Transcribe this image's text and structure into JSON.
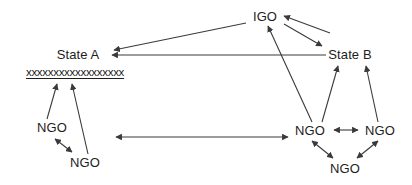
{
  "diagram": {
    "background_color": "#ffffff",
    "line_color": "#3a3a3a",
    "text_color": "#1d1d1d",
    "nodes": [
      {
        "id": "igo",
        "label": "IGO",
        "x": 265,
        "y": 16,
        "kind": "igo"
      },
      {
        "id": "state-a",
        "label": "State A",
        "x": 78,
        "y": 54,
        "kind": "state"
      },
      {
        "id": "state-b",
        "label": "State B",
        "x": 350,
        "y": 54,
        "kind": "state"
      },
      {
        "id": "redacted",
        "label": "xxxxxxxxxxxxxxxxxx",
        "x": 75,
        "y": 72,
        "kind": "redacted"
      },
      {
        "id": "ngo-left-1",
        "label": "NGO",
        "x": 52,
        "y": 127,
        "kind": "ngo"
      },
      {
        "id": "ngo-left-2",
        "label": "NGO",
        "x": 85,
        "y": 162,
        "kind": "ngo"
      },
      {
        "id": "ngo-right-1",
        "label": "NGO",
        "x": 310,
        "y": 130,
        "kind": "ngo"
      },
      {
        "id": "ngo-right-2",
        "label": "NGO",
        "x": 380,
        "y": 130,
        "kind": "ngo"
      },
      {
        "id": "ngo-right-3",
        "label": "NGO",
        "x": 345,
        "y": 168,
        "kind": "ngo"
      }
    ],
    "edges": [
      {
        "id": "igo-to-state-a",
        "from": "igo",
        "to": "state-a",
        "direction": "one-way"
      },
      {
        "id": "igo-to-state-b",
        "from": "igo",
        "to": "state-b",
        "direction": "one-way"
      },
      {
        "id": "state-b-to-igo",
        "from": "state-b",
        "to": "igo",
        "direction": "one-way"
      },
      {
        "id": "state-b-to-state-a",
        "from": "state-b",
        "to": "state-a",
        "direction": "one-way"
      },
      {
        "id": "ngo-right-1-to-igo",
        "from": "ngo-right-1",
        "to": "igo",
        "direction": "one-way"
      },
      {
        "id": "ngo-right-1-to-state-b",
        "from": "ngo-right-1",
        "to": "state-b",
        "direction": "one-way"
      },
      {
        "id": "ngo-right-2-to-state-b",
        "from": "ngo-right-2",
        "to": "state-b",
        "direction": "one-way"
      },
      {
        "id": "ngo-right-1-ngo-right-2",
        "from": "ngo-right-1",
        "to": "ngo-right-2",
        "direction": "two-way"
      },
      {
        "id": "ngo-right-1-ngo-right-3",
        "from": "ngo-right-1",
        "to": "ngo-right-3",
        "direction": "two-way"
      },
      {
        "id": "ngo-right-2-ngo-right-3",
        "from": "ngo-right-2",
        "to": "ngo-right-3",
        "direction": "two-way"
      },
      {
        "id": "ngo-left-1-to-state-a",
        "from": "ngo-left-1",
        "to": "redacted",
        "direction": "one-way"
      },
      {
        "id": "ngo-left-2-to-state-a",
        "from": "ngo-left-2",
        "to": "redacted",
        "direction": "one-way"
      },
      {
        "id": "ngo-left-1-ngo-left-2",
        "from": "ngo-left-1",
        "to": "ngo-left-2",
        "direction": "two-way"
      },
      {
        "id": "ngo-left-cluster-ngo-right-1",
        "from": "ngo-left-2",
        "to": "ngo-right-1",
        "direction": "two-way"
      }
    ]
  }
}
